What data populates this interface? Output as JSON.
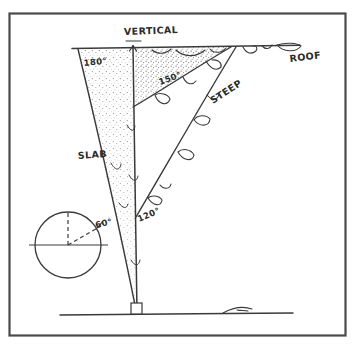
{
  "figure": {
    "background_color": "#ffffff",
    "ink_color": "#3a3a3a",
    "frame": {
      "name": "diagram-border",
      "color": "#4a4a4a",
      "x": 9,
      "y": 13,
      "width": 337,
      "height": 323
    }
  },
  "labels": {
    "vertical": "VERTICAL",
    "roof": "ROOF",
    "slab": "SLAB",
    "steep": "STEEP",
    "angle_slab": "180°",
    "angle_overhang": "150°",
    "angle_steep": "120°",
    "angle_compass": "60°"
  },
  "lines": {
    "roof_line": {
      "name": "roof-horizontal-line",
      "x1": 72,
      "y1": 48,
      "x2": 300,
      "y2": 45
    },
    "ground_line": {
      "name": "ground-horizontal-line",
      "x1": 60,
      "y1": 315,
      "x2": 293,
      "y2": 313
    },
    "vertical_line": {
      "name": "vertical-reference-line",
      "x1": 133,
      "y1": 44,
      "x2": 137,
      "y2": 312
    },
    "slab_line": {
      "name": "slab-angle-line",
      "x1": 78,
      "y1": 49,
      "x2": 136,
      "y2": 310
    },
    "overhang_line": {
      "name": "overhang-angle-line",
      "x1": 231,
      "y1": 47,
      "x2": 133,
      "y2": 107
    },
    "steep_line": {
      "name": "steep-angle-line",
      "x1": 236,
      "y1": 47,
      "x2": 136,
      "y2": 217
    }
  },
  "compass": {
    "name": "angle-compass-diagram",
    "center_x": 68,
    "center_y": 245,
    "radius": 33,
    "horizontal_axis": true,
    "vertical_dashed_radius": true,
    "angled_dashed_radius_deg": 60
  },
  "markers": {
    "base_block": {
      "name": "base-block-marker",
      "x": 131,
      "y": 303,
      "width": 11,
      "height": 11
    },
    "vertical_arrow": {
      "name": "vertical-arrow-head",
      "x": 133,
      "y": 44
    }
  }
}
